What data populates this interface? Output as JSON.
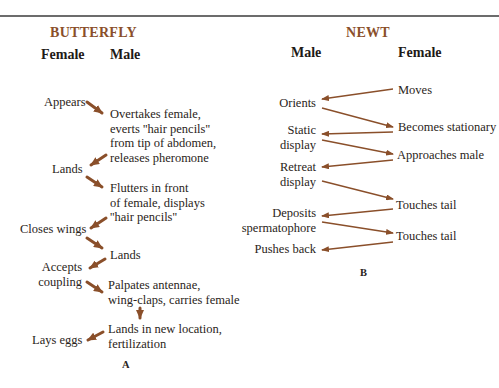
{
  "butterfly": {
    "title": "BUTTERFLY",
    "col_female": "Female",
    "col_male": "Male",
    "female_steps": [
      "Appears",
      "Lands",
      "Closes wings",
      "Accepts coupling",
      "Lays eggs"
    ],
    "female_lines": {
      "appears": "Appears",
      "lands": "Lands",
      "closes_wings": "Closes wings",
      "accepts_1": "Accepts",
      "accepts_2": "coupling",
      "lays_eggs": "Lays eggs"
    },
    "male_lines": {
      "s1_1": "Overtakes female,",
      "s1_2": "everts ''hair pencils''",
      "s1_3": "from tip of abdomen,",
      "s1_4": "releases pheromone",
      "s2_1": "Flutters in front",
      "s2_2": "of female, displays",
      "s2_3": "''hair pencils''",
      "s3_1": "Lands",
      "s4_1": "Palpates antennae,",
      "s4_2": "wing-claps, carries female",
      "s5_1": "Lands in new location,",
      "s5_2": "fertilization"
    },
    "panel_label": "A"
  },
  "newt": {
    "title": "NEWT",
    "col_male": "Male",
    "col_female": "Female",
    "male_lines": {
      "orients": "Orients",
      "static_1": "Static",
      "static_2": "display",
      "retreat_1": "Retreat",
      "retreat_2": "display",
      "deposits_1": "Deposits",
      "deposits_2": "spermatophore",
      "pushes_back": "Pushes back"
    },
    "female_lines": {
      "moves": "Moves",
      "stationary": "Becomes stationary",
      "approaches": "Approaches male",
      "touches_1": "Touches tail",
      "touches_2": "Touches tail"
    },
    "panel_label": "B"
  },
  "colors": {
    "title": "#8a4f2a",
    "arrow": "#8a4f2a",
    "rule": "#6c6c6c"
  }
}
